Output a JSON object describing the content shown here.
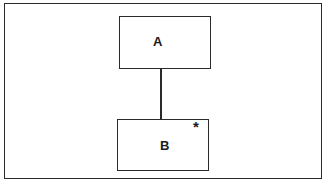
{
  "diagram": {
    "nodes": [
      {
        "id": "A",
        "label": "A"
      },
      {
        "id": "B",
        "label": "B",
        "marker": "*"
      }
    ],
    "edges": [
      {
        "from": "A",
        "to": "B"
      }
    ]
  }
}
